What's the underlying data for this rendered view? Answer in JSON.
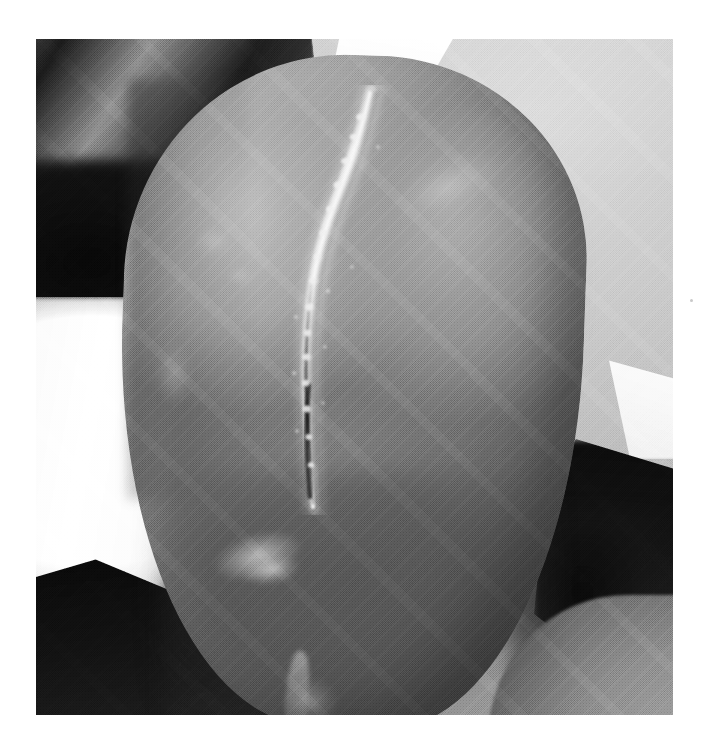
{
  "page": {
    "background_color": "#ffffff",
    "width": 708,
    "height": 742,
    "caption": ""
  },
  "photograph": {
    "kind": "clinical-photograph",
    "color_mode": "grayscale",
    "frame": {
      "left": 36,
      "top": 39,
      "width": 637,
      "height": 676
    },
    "subject": "scrotum with midline raphe showing linear crusted scaly lesion",
    "orientation": "portrait",
    "visible_text": "",
    "palette": {
      "backdrop_gray": "#c3c3c3",
      "drape_white": "#f7f7f7",
      "drape_dark": "#141414",
      "skin_highlight": "#b1b1b1",
      "skin_midtone": "#8b8b8b",
      "skin_shadow": "#4d4d4d",
      "cast_shadow": "#111111",
      "scar_highlight": "#e2e2e2",
      "fissure_dark": "#2a2a2a"
    },
    "regions": [
      {
        "name": "dark-folded-drape",
        "position": "upper-left",
        "tone": "near-black with folds"
      },
      {
        "name": "white-drape-left",
        "position": "mid-left",
        "tone": "bright white"
      },
      {
        "name": "dark-shadow-lower-left",
        "position": "lower-left",
        "tone": "black wedge"
      },
      {
        "name": "white-wedge-top",
        "position": "top-center",
        "tone": "bright white triangle"
      },
      {
        "name": "white-streak-artifact",
        "position": "top-center-right",
        "tone": "white linear streak"
      },
      {
        "name": "white-wedge-right",
        "position": "mid-right",
        "tone": "bright white triangle"
      },
      {
        "name": "cast-shadow-right",
        "position": "right-center-lower",
        "tone": "deep shadow"
      },
      {
        "name": "thigh-lower-right",
        "position": "lower-right",
        "tone": "mid gray skin"
      },
      {
        "name": "scrotum-left-lobe",
        "position": "center-left",
        "tone": "light gray, highlighted"
      },
      {
        "name": "scrotum-right-lobe",
        "position": "center-right",
        "tone": "mid gray"
      },
      {
        "name": "median-raphe-lesion",
        "position": "center, vertical midline",
        "tone": "white crusted ridge with dark fissure"
      },
      {
        "name": "scaly-plaque-lower-left",
        "position": "lower-left of organ",
        "tone": "pale scaling"
      }
    ]
  }
}
